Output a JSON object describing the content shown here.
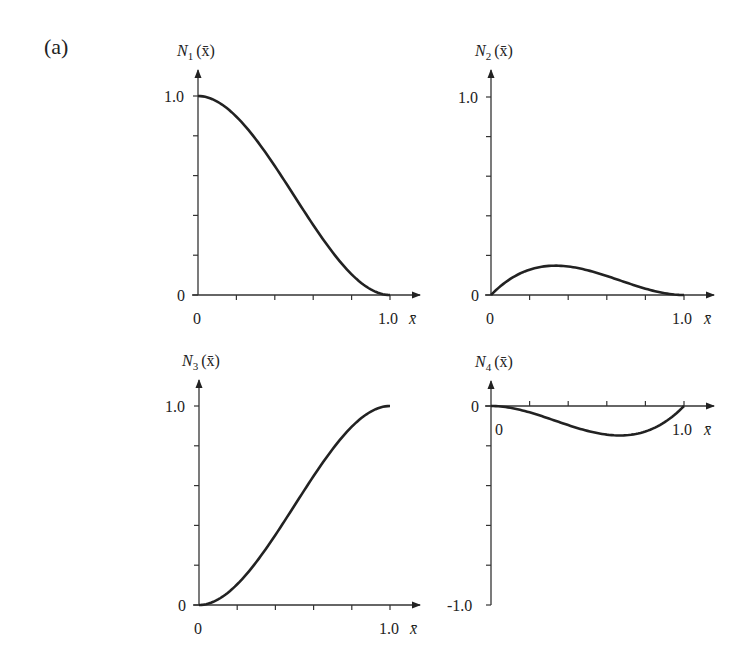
{
  "figure": {
    "panel_label": "(a)"
  },
  "chart_data": [
    {
      "type": "line",
      "title": "N1(x̄)",
      "ylabel_main": "N",
      "ylabel_sub": "1",
      "ylabel_arg": "(x̄)",
      "xlabel": "x̄",
      "x_tick_labels": [
        "0",
        "1.0"
      ],
      "y_tick_labels": [
        "0",
        "1.0"
      ],
      "xlim": [
        0,
        1.0
      ],
      "ylim": [
        0,
        1.0
      ],
      "x_minor_ticks": 5,
      "y_minor_ticks": 5,
      "grid": false,
      "x": [
        0,
        0.1,
        0.2,
        0.3,
        0.4,
        0.5,
        0.6,
        0.7,
        0.8,
        0.9,
        1.0
      ],
      "values": [
        1.0,
        0.972,
        0.896,
        0.784,
        0.648,
        0.5,
        0.352,
        0.216,
        0.104,
        0.028,
        0.0
      ]
    },
    {
      "type": "line",
      "title": "N2(x̄)",
      "ylabel_main": "N",
      "ylabel_sub": "2",
      "ylabel_arg": "(x̄)",
      "xlabel": "x̄",
      "x_tick_labels": [
        "0",
        "1.0"
      ],
      "y_tick_labels": [
        "0",
        "1.0"
      ],
      "xlim": [
        0,
        1.0
      ],
      "ylim": [
        0,
        1.0
      ],
      "x_minor_ticks": 5,
      "y_minor_ticks": 5,
      "grid": false,
      "x": [
        0,
        0.1,
        0.2,
        0.3,
        0.4,
        0.5,
        0.6,
        0.7,
        0.8,
        0.9,
        1.0
      ],
      "values": [
        0.0,
        0.081,
        0.128,
        0.147,
        0.144,
        0.125,
        0.096,
        0.063,
        0.032,
        0.009,
        0.0
      ]
    },
    {
      "type": "line",
      "title": "N3(x̄)",
      "ylabel_main": "N",
      "ylabel_sub": "3",
      "ylabel_arg": "(x̄)",
      "xlabel": "x̄",
      "x_tick_labels": [
        "0",
        "1.0"
      ],
      "y_tick_labels": [
        "0",
        "1.0"
      ],
      "xlim": [
        0,
        1.0
      ],
      "ylim": [
        0,
        1.0
      ],
      "x_minor_ticks": 5,
      "y_minor_ticks": 5,
      "grid": false,
      "x": [
        0,
        0.1,
        0.2,
        0.3,
        0.4,
        0.5,
        0.6,
        0.7,
        0.8,
        0.9,
        1.0
      ],
      "values": [
        0.0,
        0.028,
        0.104,
        0.216,
        0.352,
        0.5,
        0.648,
        0.784,
        0.896,
        0.972,
        1.0
      ]
    },
    {
      "type": "line",
      "title": "N4(x̄)",
      "ylabel_main": "N",
      "ylabel_sub": "4",
      "ylabel_arg": "(x̄)",
      "xlabel": "x̄",
      "x_tick_labels": [
        "0",
        "1.0"
      ],
      "y_tick_labels": [
        "0",
        "-1.0"
      ],
      "xlim": [
        0,
        1.0
      ],
      "ylim": [
        -1.0,
        0
      ],
      "x_minor_ticks": 5,
      "y_minor_ticks": 5,
      "grid": false,
      "x": [
        0,
        0.1,
        0.2,
        0.3,
        0.4,
        0.5,
        0.6,
        0.7,
        0.8,
        0.9,
        1.0
      ],
      "values": [
        0.0,
        -0.009,
        -0.032,
        -0.063,
        -0.096,
        -0.125,
        -0.144,
        -0.147,
        -0.128,
        -0.081,
        0.0
      ]
    }
  ],
  "layout": {
    "line_color": "#222222",
    "axis_color": "#333333"
  }
}
